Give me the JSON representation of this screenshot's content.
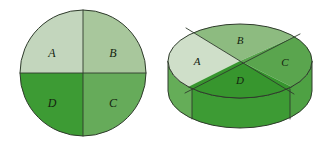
{
  "figure": {
    "background_color": "#ffffff",
    "outline_color": "#2f3b2c",
    "label_color": "#14240f"
  },
  "flat_circle": {
    "name": "flat-circle-diagram",
    "center": {
      "x": 83,
      "y": 73
    },
    "radius": 63,
    "sectors": [
      {
        "id": "A",
        "label": "A",
        "position": "top-left",
        "fill": "#c3d6bd",
        "label_x": 52,
        "label_y": 54
      },
      {
        "id": "B",
        "label": "B",
        "position": "top-right",
        "fill": "#a8c79c",
        "label_x": 113,
        "label_y": 54
      },
      {
        "id": "C",
        "label": "C",
        "position": "bottom-right",
        "fill": "#66ab5a",
        "label_x": 113,
        "label_y": 104
      },
      {
        "id": "D",
        "label": "D",
        "position": "bottom-left",
        "fill": "#3d9b34",
        "label_x": 52,
        "label_y": 104
      }
    ],
    "dividers": [
      "vertical-diameter",
      "horizontal-diameter"
    ]
  },
  "disc_3d": {
    "name": "cylinder-disc-diagram",
    "top_ellipse": {
      "cx": 240,
      "cy": 61,
      "rx": 72,
      "ry": 37
    },
    "bottom_ellipse": {
      "cx": 240,
      "cy": 91,
      "rx": 72,
      "ry": 37
    },
    "height": 30,
    "sectors": [
      {
        "id": "A",
        "label": "A",
        "position": "left",
        "fill": "#cfdfc9",
        "label_x": 197,
        "label_y": 62
      },
      {
        "id": "B",
        "label": "B",
        "position": "top",
        "fill": "#8dbb80",
        "label_x": 240,
        "label_y": 42
      },
      {
        "id": "C",
        "label": "C",
        "position": "right",
        "fill": "#5aa54e",
        "label_x": 285,
        "label_y": 63
      },
      {
        "id": "D",
        "label": "D",
        "position": "bottom",
        "fill": "#37962e",
        "label_x": 240,
        "label_y": 80
      }
    ],
    "side_wall": {
      "fill_front": "#3d9b34",
      "fill_left": "#65ad58",
      "fill_right": "#4ea143",
      "seam_lines": 3
    }
  }
}
